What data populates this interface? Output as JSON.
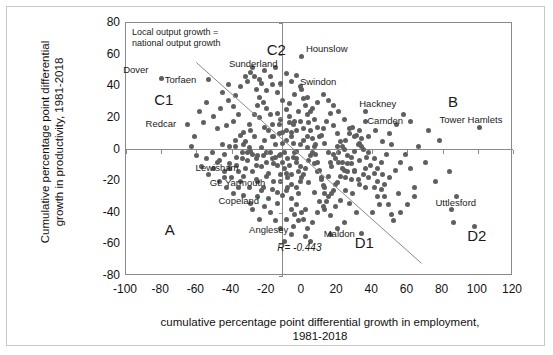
{
  "chart_data": {
    "type": "scatter",
    "title": "",
    "xlabel": "cumulative percentage point differential growth in employment, 1981-2018",
    "xlabel_line1": "cumulative percentage point differential growth in employment,",
    "xlabel_line2": "1981-2018",
    "ylabel": "Cumulative percentage point differential growth in productivity, 1981-2018",
    "ylabel_line1": "Cumulative percentage point differential",
    "ylabel_line2": "growth in productivity, 1981-2018",
    "xlim": [
      -100,
      120
    ],
    "ylim": [
      -80,
      80
    ],
    "xticks": [
      -100,
      -80,
      -60,
      -40,
      -20,
      0,
      20,
      40,
      60,
      80,
      100,
      120
    ],
    "yticks": [
      80,
      60,
      40,
      20,
      0,
      -20,
      -40,
      -60,
      -80
    ],
    "xtick_labels": [
      "-100",
      "-80",
      "-60",
      "-40",
      "-20",
      "0",
      "20",
      "40",
      "60",
      "80",
      "100",
      "120"
    ],
    "ytick_labels": [
      "80",
      "60",
      "40",
      "20",
      "0",
      "-20",
      "-40",
      "-60",
      "-80"
    ],
    "grid": false,
    "legend_position": "none",
    "point_color": "#5f5f5f",
    "axis_color": "#8a8a8a",
    "correlation_label": "R= -0.443",
    "correlation_value": -0.443,
    "reference_line": {
      "label_line1": "Local output growth =",
      "label_line2": "national output growth",
      "x_start": -60,
      "y_start": 55,
      "x_end": 68,
      "y_end": -72
    },
    "quadrant_labels": [
      {
        "name": "C1",
        "text": "C1",
        "x": -84,
        "y": 31
      },
      {
        "name": "C2",
        "text": "C2",
        "x": -20,
        "y": 63
      },
      {
        "name": "B",
        "text": "B",
        "x": 83,
        "y": 30
      },
      {
        "name": "A",
        "text": "A",
        "x": -78,
        "y": -51
      },
      {
        "name": "D1",
        "text": "D1",
        "x": 30,
        "y": -59
      },
      {
        "name": "D2",
        "text": "D2",
        "x": 94,
        "y": -55
      }
    ],
    "annotated_points": [
      {
        "name": "Dover",
        "label": "Dover",
        "x": -80,
        "y": 45
      },
      {
        "name": "Torfaen",
        "label": "Torfaen",
        "x": -53,
        "y": 44
      },
      {
        "name": "Redcar",
        "label": "Redcar",
        "x": -65,
        "y": 16
      },
      {
        "name": "Sunderland",
        "label": "Sunderland",
        "x": -29,
        "y": 49
      },
      {
        "name": "Hounslow",
        "label": "Hounslow",
        "x": 0,
        "y": 59
      },
      {
        "name": "Swindon",
        "label": "Swindon",
        "x": 0,
        "y": 38
      },
      {
        "name": "Hackney",
        "label": "Hackney",
        "x": 36,
        "y": 24
      },
      {
        "name": "Camden",
        "label": "Camden",
        "x": 36,
        "y": 18
      },
      {
        "name": "Tower Hamlets",
        "label": "Tower Hamlets",
        "x": 101,
        "y": 14
      },
      {
        "name": "Lewisham",
        "label": "Lewisham",
        "x": -32,
        "y": -12
      },
      {
        "name": "Gt. Yarmouth",
        "label": "Gt. Yarmouth",
        "x": -16,
        "y": -20
      },
      {
        "name": "Copeland",
        "label": "Copeland",
        "x": -19,
        "y": -31
      },
      {
        "name": "Anglesey",
        "label": "Anglesey",
        "x": -5,
        "y": -49
      },
      {
        "name": "Maldon",
        "label": "Maldon",
        "x": 34,
        "y": -53
      },
      {
        "name": "Uttlesford",
        "label": "Uttlesford",
        "x": 85,
        "y": -38
      }
    ],
    "points": [
      [
        -80,
        45
      ],
      [
        -53,
        44
      ],
      [
        -65,
        16
      ],
      [
        -56,
        17
      ],
      [
        -48,
        13
      ],
      [
        -43,
        15
      ],
      [
        -39,
        18
      ],
      [
        -45,
        3
      ],
      [
        -38,
        2
      ],
      [
        -41,
        -9
      ],
      [
        -36,
        -14
      ],
      [
        -34,
        -6
      ],
      [
        -33,
        -17
      ],
      [
        -29,
        49
      ],
      [
        -31,
        43
      ],
      [
        -27,
        46
      ],
      [
        -26,
        38
      ],
      [
        -24,
        33
      ],
      [
        -22,
        30
      ],
      [
        -20,
        26
      ],
      [
        -24,
        20
      ],
      [
        -18,
        22
      ],
      [
        -21,
        14
      ],
      [
        -17,
        16
      ],
      [
        -14,
        23
      ],
      [
        -12,
        19
      ],
      [
        -16,
        8
      ],
      [
        -13,
        10
      ],
      [
        -11,
        4
      ],
      [
        -9,
        12
      ],
      [
        -7,
        17
      ],
      [
        -6,
        8
      ],
      [
        -10,
        -2
      ],
      [
        -8,
        -6
      ],
      [
        -12,
        -3
      ],
      [
        -15,
        -5
      ],
      [
        -18,
        -2
      ],
      [
        -20,
        -8
      ],
      [
        -22,
        -4
      ],
      [
        -26,
        -10
      ],
      [
        -28,
        -3
      ],
      [
        -30,
        1
      ],
      [
        -32,
        -12
      ],
      [
        -35,
        -20
      ],
      [
        -30,
        -24
      ],
      [
        -26,
        -19
      ],
      [
        -23,
        -26
      ],
      [
        -19,
        -31
      ],
      [
        -16,
        -20
      ],
      [
        -14,
        -27
      ],
      [
        -12,
        -16
      ],
      [
        -10,
        -12
      ],
      [
        -8,
        -18
      ],
      [
        -6,
        -22
      ],
      [
        -5,
        -49
      ],
      [
        -4,
        -41
      ],
      [
        -3,
        -35
      ],
      [
        -2,
        -28
      ],
      [
        -1,
        -20
      ],
      [
        -2,
        -14
      ],
      [
        -3,
        -8
      ],
      [
        -4,
        -2
      ],
      [
        -5,
        4
      ],
      [
        -6,
        11
      ],
      [
        -4,
        18
      ],
      [
        -2,
        24
      ],
      [
        0,
        59
      ],
      [
        0,
        38
      ],
      [
        1,
        32
      ],
      [
        2,
        28
      ],
      [
        3,
        22
      ],
      [
        4,
        17
      ],
      [
        5,
        12
      ],
      [
        6,
        7
      ],
      [
        7,
        2
      ],
      [
        8,
        -3
      ],
      [
        9,
        -8
      ],
      [
        10,
        -13
      ],
      [
        11,
        -18
      ],
      [
        12,
        -23
      ],
      [
        13,
        -28
      ],
      [
        14,
        -33
      ],
      [
        2,
        -38
      ],
      [
        1,
        -44
      ],
      [
        3,
        -50
      ],
      [
        6,
        -46
      ],
      [
        9,
        -40
      ],
      [
        12,
        -36
      ],
      [
        15,
        -30
      ],
      [
        18,
        -26
      ],
      [
        20,
        -21
      ],
      [
        22,
        -17
      ],
      [
        24,
        -13
      ],
      [
        26,
        -9
      ],
      [
        28,
        -5
      ],
      [
        30,
        -1
      ],
      [
        32,
        3
      ],
      [
        34,
        7
      ],
      [
        36,
        24
      ],
      [
        36,
        18
      ],
      [
        33,
        12
      ],
      [
        30,
        8
      ],
      [
        27,
        13
      ],
      [
        24,
        19
      ],
      [
        21,
        24
      ],
      [
        18,
        28
      ],
      [
        15,
        31
      ],
      [
        12,
        35
      ],
      [
        9,
        30
      ],
      [
        6,
        26
      ],
      [
        3,
        33
      ],
      [
        -1,
        40
      ],
      [
        -4,
        35
      ],
      [
        -7,
        29
      ],
      [
        -9,
        25
      ],
      [
        -11,
        31
      ],
      [
        -14,
        36
      ],
      [
        -17,
        41
      ],
      [
        -20,
        37
      ],
      [
        -23,
        42
      ],
      [
        -25,
        28
      ],
      [
        -27,
        22
      ],
      [
        -30,
        16
      ],
      [
        -33,
        11
      ],
      [
        -36,
        22
      ],
      [
        -39,
        27
      ],
      [
        -42,
        31
      ],
      [
        -46,
        26
      ],
      [
        -50,
        21
      ],
      [
        -54,
        30
      ],
      [
        -58,
        24
      ],
      [
        -61,
        8
      ],
      [
        -63,
        2
      ],
      [
        -60,
        -4
      ],
      [
        -57,
        -11
      ],
      [
        -54,
        -6
      ],
      [
        -51,
        -2
      ],
      [
        -48,
        -8
      ],
      [
        -44,
        -14
      ],
      [
        -40,
        -18
      ],
      [
        -37,
        -10
      ],
      [
        -34,
        -2
      ],
      [
        -31,
        -7
      ],
      [
        -28,
        -14
      ],
      [
        -25,
        -20
      ],
      [
        -22,
        -24
      ],
      [
        -19,
        -15
      ],
      [
        -16,
        -9
      ],
      [
        -13,
        -4
      ],
      [
        -11,
        -8
      ],
      [
        -9,
        -15
      ],
      [
        -7,
        -10
      ],
      [
        -5,
        -5
      ],
      [
        -3,
        -1
      ],
      [
        -1,
        3
      ],
      [
        1,
        6
      ],
      [
        3,
        1
      ],
      [
        5,
        -4
      ],
      [
        7,
        -9
      ],
      [
        9,
        -14
      ],
      [
        11,
        -19
      ],
      [
        13,
        -24
      ],
      [
        15,
        -17
      ],
      [
        17,
        -11
      ],
      [
        19,
        -6
      ],
      [
        21,
        -2
      ],
      [
        23,
        2
      ],
      [
        25,
        6
      ],
      [
        27,
        10
      ],
      [
        29,
        14
      ],
      [
        31,
        9
      ],
      [
        33,
        4
      ],
      [
        35,
        0
      ],
      [
        37,
        -5
      ],
      [
        39,
        -10
      ],
      [
        41,
        -15
      ],
      [
        43,
        -20
      ],
      [
        45,
        -25
      ],
      [
        47,
        -30
      ],
      [
        49,
        -35
      ],
      [
        51,
        -41
      ],
      [
        34,
        -53
      ],
      [
        43,
        -30
      ],
      [
        47,
        -22
      ],
      [
        50,
        -18
      ],
      [
        53,
        -13
      ],
      [
        56,
        -8
      ],
      [
        59,
        -3
      ],
      [
        62,
        -12
      ],
      [
        64,
        -24
      ],
      [
        55,
        -28
      ],
      [
        41,
        -24
      ],
      [
        38,
        -18
      ],
      [
        36,
        -12
      ],
      [
        33,
        -7
      ],
      [
        30,
        -13
      ],
      [
        28,
        -19
      ],
      [
        25,
        -26
      ],
      [
        22,
        -32
      ],
      [
        19,
        -36
      ],
      [
        16,
        -42
      ],
      [
        13,
        -38
      ],
      [
        10,
        -33
      ],
      [
        7,
        -27
      ],
      [
        4,
        -21
      ],
      [
        1,
        -16
      ],
      [
        -1,
        -11
      ],
      [
        -3,
        -6
      ],
      [
        -6,
        -16
      ],
      [
        -8,
        -24
      ],
      [
        -11,
        -29
      ],
      [
        -14,
        -34
      ],
      [
        -17,
        -25
      ],
      [
        -20,
        -17
      ],
      [
        -23,
        -11
      ],
      [
        -26,
        -6
      ],
      [
        -29,
        -1
      ],
      [
        -32,
        5
      ],
      [
        -35,
        9
      ],
      [
        -38,
        6
      ],
      [
        -41,
        2
      ],
      [
        -44,
        -3
      ],
      [
        -47,
        -7
      ],
      [
        -50,
        -12
      ],
      [
        -53,
        -16
      ],
      [
        -47,
        -20
      ],
      [
        -43,
        -24
      ],
      [
        -39,
        -28
      ],
      [
        -36,
        -24
      ],
      [
        -33,
        -29
      ],
      [
        -29,
        -34
      ],
      [
        -25,
        -30
      ],
      [
        -21,
        -36
      ],
      [
        -18,
        -40
      ],
      [
        -15,
        -45
      ],
      [
        -12,
        -50
      ],
      [
        -9,
        -44
      ],
      [
        -6,
        -38
      ],
      [
        85,
        -38
      ],
      [
        84,
        -14
      ],
      [
        86,
        -46
      ],
      [
        101,
        14
      ],
      [
        98,
        -49
      ],
      [
        88,
        -30
      ],
      [
        76,
        -20
      ],
      [
        70,
        -8
      ],
      [
        66,
        2
      ],
      [
        72,
        12
      ],
      [
        78,
        6
      ],
      [
        62,
        18
      ],
      [
        58,
        22
      ],
      [
        54,
        16
      ],
      [
        50,
        10
      ],
      [
        46,
        5
      ],
      [
        42,
        12
      ],
      [
        38,
        8
      ],
      [
        34,
        2
      ],
      [
        64,
        -30
      ],
      [
        60,
        -35
      ],
      [
        56,
        -40
      ],
      [
        52,
        -45
      ],
      [
        44,
        -35
      ],
      [
        40,
        -40
      ],
      [
        24,
        -46
      ],
      [
        20,
        -50
      ],
      [
        16,
        -54
      ],
      [
        -45,
        36
      ],
      [
        -42,
        41
      ],
      [
        -38,
        34
      ],
      [
        -35,
        40
      ],
      [
        -32,
        46
      ],
      [
        -28,
        52
      ],
      [
        -24,
        44
      ],
      [
        -21,
        50
      ],
      [
        -18,
        46
      ],
      [
        -15,
        52
      ],
      [
        -12,
        42
      ],
      [
        -9,
        48
      ],
      [
        -6,
        43
      ],
      [
        -3,
        47
      ],
      [
        -12,
        -20
      ],
      [
        -9,
        -26
      ],
      [
        -6,
        -31
      ],
      [
        -3,
        -24
      ],
      [
        0,
        -18
      ],
      [
        2,
        -12
      ],
      [
        4,
        -7
      ],
      [
        6,
        -2
      ],
      [
        8,
        3
      ],
      [
        10,
        8
      ],
      [
        12,
        13
      ],
      [
        14,
        18
      ],
      [
        16,
        23
      ],
      [
        18,
        15
      ],
      [
        20,
        10
      ],
      [
        22,
        5
      ],
      [
        24,
        0
      ],
      [
        26,
        -4
      ],
      [
        28,
        -9
      ],
      [
        30,
        -14
      ],
      [
        32,
        -19
      ],
      [
        36,
        -24
      ],
      [
        2,
        -55
      ],
      [
        5,
        -58
      ],
      [
        -14,
        -10
      ],
      [
        -17,
        -6
      ],
      [
        -20,
        -2
      ],
      [
        -2,
        -45
      ],
      [
        0,
        -40
      ],
      [
        -24,
        -44
      ],
      [
        -28,
        -38
      ],
      [
        -6,
        -54
      ],
      [
        -10,
        -58
      ],
      [
        16,
        -8
      ],
      [
        18,
        -3
      ],
      [
        20,
        2
      ],
      [
        23,
        -8
      ],
      [
        26,
        -14
      ],
      [
        15,
        -2
      ],
      [
        13,
        4
      ],
      [
        11,
        9
      ],
      [
        9,
        14
      ],
      [
        7,
        19
      ],
      [
        5,
        24
      ],
      [
        3,
        8
      ],
      [
        1,
        13
      ],
      [
        -1,
        18
      ],
      [
        -3,
        12
      ],
      [
        -5,
        16
      ],
      [
        -7,
        21
      ],
      [
        -9,
        6
      ],
      [
        -11,
        11
      ],
      [
        -13,
        16
      ],
      [
        -15,
        3
      ],
      [
        -17,
        8
      ],
      [
        -19,
        12
      ],
      [
        -21,
        6
      ],
      [
        -23,
        1
      ],
      [
        -25,
        -4
      ],
      [
        -27,
        8
      ],
      [
        -29,
        12
      ],
      [
        -31,
        -2
      ],
      [
        -33,
        3
      ],
      [
        -37,
        -5
      ],
      [
        -41,
        -12
      ],
      [
        -44,
        -18
      ],
      [
        45,
        -8
      ],
      [
        48,
        -3
      ],
      [
        51,
        3
      ],
      [
        38,
        -2
      ],
      [
        35,
        -16
      ],
      [
        41,
        -6
      ],
      [
        33,
        -22
      ],
      [
        29,
        -28
      ],
      [
        27,
        -34
      ],
      [
        31,
        -40
      ],
      [
        25,
        -18
      ],
      [
        23,
        -12
      ],
      [
        21,
        -8
      ],
      [
        19,
        -22
      ],
      [
        17,
        -28
      ],
      [
        46,
        -16
      ],
      [
        43,
        -12
      ]
    ]
  }
}
